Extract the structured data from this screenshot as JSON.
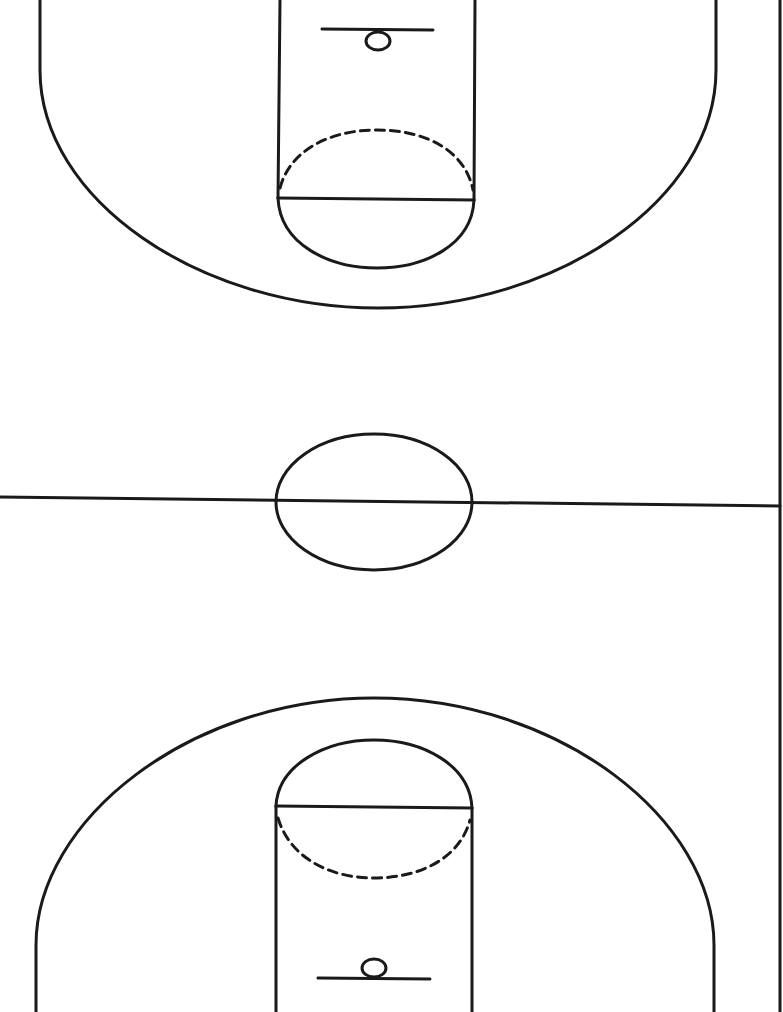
{
  "diagram": {
    "line_color": "#1a1a1a",
    "background": "#ffffff",
    "line_width": 3,
    "elements": {
      "top_basket": {
        "hoop": "hoop",
        "backboard": "backboard"
      },
      "top_key": {
        "lane": "lane",
        "free_throw_line": "free-throw line",
        "free_throw_circle_top": "solid half circle",
        "free_throw_circle_bottom": "dashed half circle"
      },
      "top_three_point_arc": "three-point arc",
      "half_court_line": "half-court line",
      "center_circle": "center circle",
      "bottom_basket": {
        "hoop": "hoop",
        "backboard": "backboard"
      },
      "bottom_key": {
        "lane": "lane",
        "free_throw_line": "free-throw line"
      },
      "bottom_three_point_arc": "three-point arc",
      "sideline": "right sideline"
    }
  }
}
